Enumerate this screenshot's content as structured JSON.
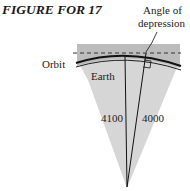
{
  "figure": {
    "title": "FIGURE FOR 17",
    "labels": {
      "angle_line1": "Angle of",
      "angle_line2": "depression",
      "orbit": "Orbit",
      "earth": "Earth",
      "radius_orbit": "4100",
      "radius_earth": "4000"
    },
    "colors": {
      "earth_fill": "#d4d4d4",
      "band_fill": "#b8b8b8",
      "lines": "#111111"
    }
  }
}
